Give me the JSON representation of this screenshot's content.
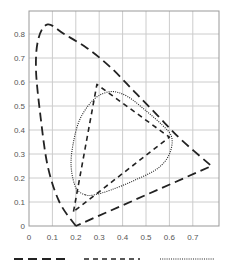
{
  "chart_data": {
    "type": "line",
    "title": "",
    "xlabel": "",
    "ylabel": "",
    "xlim": [
      0,
      0.8
    ],
    "ylim": [
      0,
      0.9
    ],
    "grid": true,
    "legend_position": "bottom",
    "x_ticks": [
      "0",
      "0.1",
      "0.2",
      "0.3",
      "0.4",
      "0.5",
      "0.6",
      "0.7"
    ],
    "y_ticks": [
      "0",
      "0.1",
      "0.2",
      "0.3",
      "0.4",
      "0.5",
      "0.6",
      "0.7",
      "0.8"
    ],
    "series": [
      {
        "name": "long-dash",
        "style": "long-dash",
        "description": "spectral locus (horseshoe)",
        "points": [
          [
            0.2,
            0.0
          ],
          [
            0.13,
            0.1
          ],
          [
            0.08,
            0.25
          ],
          [
            0.05,
            0.45
          ],
          [
            0.03,
            0.65
          ],
          [
            0.04,
            0.78
          ],
          [
            0.08,
            0.84
          ],
          [
            0.15,
            0.8
          ],
          [
            0.25,
            0.74
          ],
          [
            0.35,
            0.66
          ],
          [
            0.45,
            0.56
          ],
          [
            0.55,
            0.46
          ],
          [
            0.65,
            0.36
          ],
          [
            0.78,
            0.25
          ],
          [
            0.2,
            0.0
          ]
        ]
      },
      {
        "name": "short-dash",
        "style": "short-dash",
        "description": "gamut triangle",
        "points": [
          [
            0.19,
            0.06
          ],
          [
            0.29,
            0.59
          ],
          [
            0.6,
            0.37
          ],
          [
            0.19,
            0.06
          ]
        ]
      },
      {
        "name": "dotted",
        "style": "dotted",
        "description": "gamut contour",
        "points": [
          [
            0.24,
            0.13
          ],
          [
            0.2,
            0.16
          ],
          [
            0.18,
            0.25
          ],
          [
            0.19,
            0.35
          ],
          [
            0.22,
            0.45
          ],
          [
            0.28,
            0.53
          ],
          [
            0.35,
            0.56
          ],
          [
            0.42,
            0.54
          ],
          [
            0.5,
            0.48
          ],
          [
            0.57,
            0.42
          ],
          [
            0.61,
            0.37
          ],
          [
            0.6,
            0.3
          ],
          [
            0.55,
            0.24
          ],
          [
            0.45,
            0.19
          ],
          [
            0.35,
            0.15
          ],
          [
            0.28,
            0.13
          ],
          [
            0.24,
            0.13
          ]
        ]
      }
    ]
  },
  "legend": {
    "items": [
      {
        "label": "",
        "style": "long-dash"
      },
      {
        "label": "",
        "style": "short-dash"
      },
      {
        "label": "",
        "style": "dotted"
      }
    ]
  }
}
